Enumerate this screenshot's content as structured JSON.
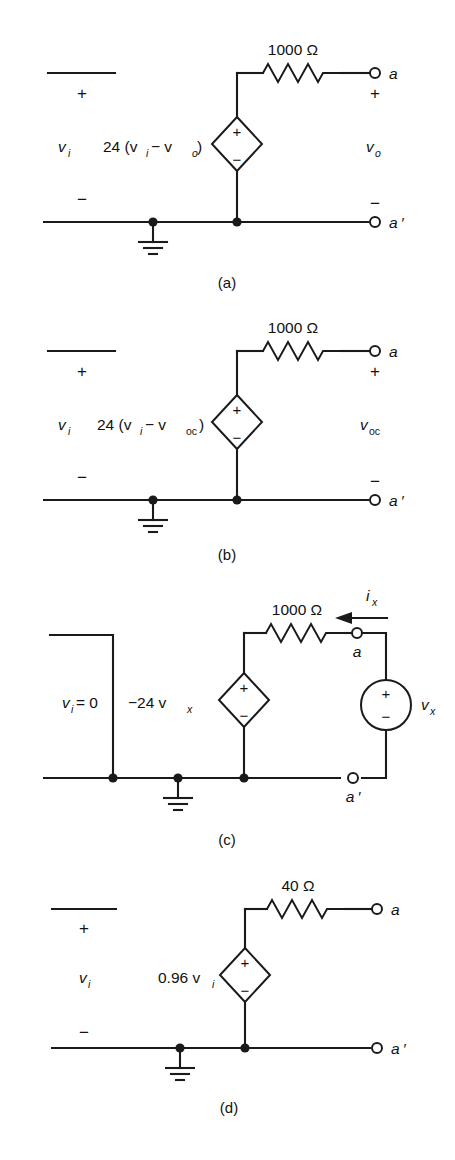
{
  "figure": {
    "type": "circuit-diagram-set",
    "panel_count": 4,
    "background": "#ffffff",
    "ink": "#1a1a1a"
  },
  "panels": [
    {
      "id": "a",
      "caption": "(a)",
      "input_label": "v",
      "input_sub": "i",
      "input_plus": "+",
      "input_minus": "−",
      "source_label_main": "24 (v",
      "source_label_sub1": "i",
      "source_label_mid": "− v",
      "source_label_sub2": "o",
      "source_label_end": ")",
      "source_plus": "+",
      "source_minus": "−",
      "resistor_value": "1000 Ω",
      "terminal_top": "a",
      "terminal_bottom": "a ′",
      "terminal_plus": "+",
      "terminal_minus": "−",
      "output_label": "v",
      "output_sub": "o",
      "has_ground": true
    },
    {
      "id": "b",
      "caption": "(b)",
      "input_label": "v",
      "input_sub": "i",
      "input_plus": "+",
      "input_minus": "−",
      "source_label_main": "24 (v",
      "source_label_sub1": "i",
      "source_label_mid": "− v",
      "source_label_sub2": "oc",
      "source_label_end": ")",
      "source_plus": "+",
      "source_minus": "−",
      "resistor_value": "1000 Ω",
      "terminal_top": "a",
      "terminal_bottom": "a ′",
      "terminal_plus": "+",
      "terminal_minus": "−",
      "output_label": "v",
      "output_sub": "oc",
      "has_ground": true
    },
    {
      "id": "c",
      "caption": "(c)",
      "input_label": "v",
      "input_sub": "i",
      "input_eq": " = 0",
      "source_label_main": "−24 v",
      "source_label_sub1": "x",
      "source_plus": "+",
      "source_minus": "−",
      "resistor_value": "1000 Ω",
      "current_label": "i",
      "current_sub": "x",
      "test_source_label": "v",
      "test_source_sub": "x",
      "test_plus": "+",
      "test_minus": "−",
      "terminal_top": "a",
      "terminal_bottom": "a ′",
      "has_ground": true
    },
    {
      "id": "d",
      "caption": "(d)",
      "input_label": "v",
      "input_sub": "i",
      "input_plus": "+",
      "input_minus": "−",
      "source_label_main": "0.96 v",
      "source_label_sub1": "i",
      "source_plus": "+",
      "source_minus": "−",
      "resistor_value": "40 Ω",
      "terminal_top": "a",
      "terminal_bottom": "a ′",
      "has_ground": true
    }
  ]
}
